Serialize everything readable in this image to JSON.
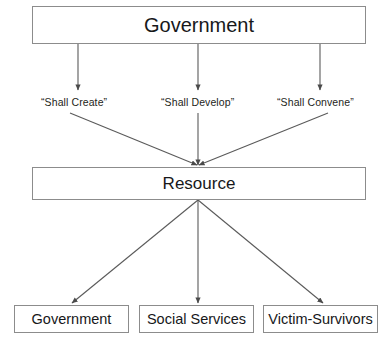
{
  "diagram": {
    "type": "flowchart",
    "background_color": "#ffffff",
    "line_color": "#5a5a5a",
    "text_color": "#17181a",
    "top_node": {
      "label": "Government"
    },
    "middle_node": {
      "label": "Resource"
    },
    "edge_labels": [
      {
        "text": "“Shall Create”"
      },
      {
        "text": "“Shall Develop”"
      },
      {
        "text": "“Shall Convene”"
      }
    ],
    "leaf_nodes": [
      {
        "label": "Government"
      },
      {
        "label": "Social Services"
      },
      {
        "label": "Victim-Survivors"
      }
    ]
  }
}
